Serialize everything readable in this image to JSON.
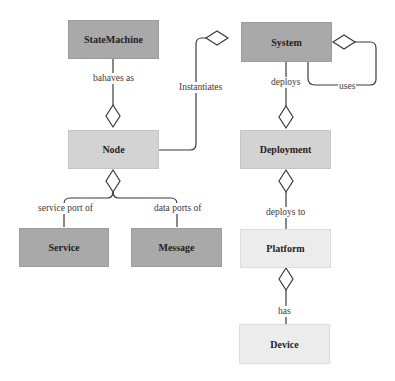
{
  "diagram": {
    "type": "uml-class-aggregation",
    "colors": {
      "dark_box": "#a9a9a9",
      "mid_box": "#d3d3d3",
      "light_box": "#ececec",
      "line": "#3a3a3a"
    },
    "nodes": {
      "statemachine": "StateMachine",
      "system": "System",
      "node": "Node",
      "deployment": "Deployment",
      "service": "Service",
      "message": "Message",
      "platform": "Platform",
      "device": "Device"
    },
    "edges": {
      "behaves_as": "bahaves as",
      "instantiates": "Instantiates",
      "deploys": "deploys",
      "uses": "uses",
      "service_port_of": "service port of",
      "data_ports_of": "data ports of",
      "deploys_to": "deploys to",
      "has": "has"
    }
  }
}
